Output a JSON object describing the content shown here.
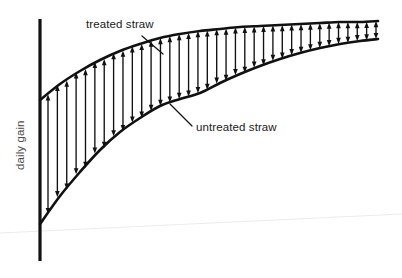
{
  "figure": {
    "width": 402,
    "height": 278,
    "background_color": "#ffffff",
    "ink_color": "#111111",
    "axis_label_color": "#4a4a4a"
  },
  "axis": {
    "y_label": "daily gain",
    "x_label": "",
    "y_axis_x": 40,
    "y_axis_top": 19,
    "y_axis_bottom": 261,
    "ticks": [],
    "tick_labels": []
  },
  "annotations": [
    {
      "name": "treated-straw",
      "text": "treated straw",
      "text_x": 86,
      "text_y": 28,
      "leader_from_x": 142,
      "leader_from_y": 36,
      "leader_to_x": 163,
      "leader_to_y": 54
    },
    {
      "name": "untreated-straw",
      "text": "untreated straw",
      "text_x": 196,
      "text_y": 131,
      "leader_from_x": 192,
      "leader_from_y": 126,
      "leader_to_x": 170,
      "leader_to_y": 104
    }
  ],
  "chart_data": {
    "type": "line",
    "title": "",
    "subtitle": "",
    "xlabel": "",
    "ylabel": "daily gain",
    "xlim": [
      40,
      380
    ],
    "ylim": [
      18,
      262
    ],
    "grid": false,
    "legend_position": "inline-annotations",
    "axis_tick_labels_shown": false,
    "annotations": [
      "treated straw",
      "untreated straw"
    ],
    "series": [
      {
        "name": "treated straw",
        "style": "solid-curve",
        "comment": "upper curve: rises steeply then plateaus",
        "x": [
          40,
          60,
          80,
          100,
          120,
          140,
          160,
          180,
          200,
          220,
          240,
          260,
          280,
          300,
          320,
          340,
          360,
          378
        ],
        "y": [
          100,
          84,
          71,
          60,
          51,
          44,
          38,
          34,
          31,
          29,
          27,
          26,
          25,
          24,
          23,
          22,
          22,
          21
        ]
      },
      {
        "name": "untreated straw",
        "style": "solid-curve",
        "comment": "lower curve: rises from axis base then plateaus",
        "x": [
          40,
          60,
          80,
          100,
          120,
          140,
          160,
          180,
          200,
          220,
          240,
          260,
          280,
          300,
          320,
          340,
          360,
          378
        ],
        "y": [
          224,
          196,
          172,
          150,
          132,
          118,
          106,
          99,
          93,
          83,
          74,
          66,
          59,
          53,
          48,
          44,
          41,
          39
        ]
      }
    ],
    "difference_arrows": {
      "type": "double-headed-vertical",
      "count": 36,
      "x_start": 48,
      "x_end": 376,
      "meaning": "vertical gap between treated and untreated straw daily gain"
    }
  }
}
